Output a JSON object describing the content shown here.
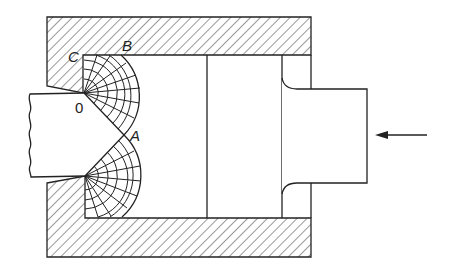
{
  "diagram": {
    "type": "technical-drawing",
    "colors": {
      "line": "#222222",
      "background": "#ffffff",
      "hatch": "#333333"
    },
    "labels": {
      "point_o": "0",
      "point_a": "A",
      "point_b": "B",
      "point_c": "C"
    },
    "arrow": {
      "direction": "left",
      "meaning": "ram force"
    },
    "components": [
      "container-wall (hatched)",
      "billet",
      "extruded-product (broken left edge)",
      "slip-line-field (upper)",
      "slip-line-field (lower)",
      "dummy-block divider",
      "ram"
    ]
  }
}
